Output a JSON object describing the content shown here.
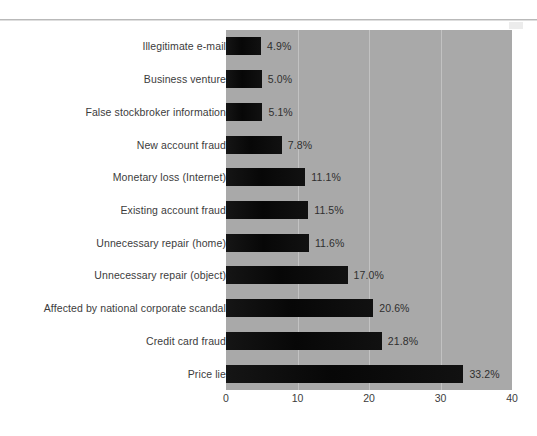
{
  "page": {
    "background_color": "#ffffff",
    "rule_color": "#b9b9b9"
  },
  "chart_data": {
    "type": "bar",
    "orientation": "horizontal",
    "title": "",
    "subtitle": "",
    "xlabel": "",
    "ylabel": "",
    "xlim": [
      0,
      40
    ],
    "xticks": [
      "0",
      "10",
      "20",
      "30",
      "40"
    ],
    "grid": true,
    "grid_axis": "x",
    "legend": false,
    "plot_background_color": "#a9a9a9",
    "bar_color": "#0d0d0d",
    "gridline_color": "#c2c2c2",
    "categories": [
      "Illegitimate e-mail",
      "Business venture",
      "False stockbroker information",
      "New account fraud",
      "Monetary loss (Internet)",
      "Existing account fraud",
      "Unnecessary repair (home)",
      "Unnecessary repair (object)",
      "Affected by national corporate scandal",
      "Credit card fraud",
      "Price lie"
    ],
    "values": [
      4.9,
      5.0,
      5.1,
      7.8,
      11.1,
      11.5,
      11.6,
      17.0,
      20.6,
      21.8,
      33.2
    ],
    "data_labels": [
      "4.9%",
      "5.0%",
      "5.1%",
      "7.8%",
      "11.1%",
      "11.5%",
      "11.6%",
      "17.0%",
      "20.6%",
      "21.8%",
      "33.2%"
    ]
  }
}
